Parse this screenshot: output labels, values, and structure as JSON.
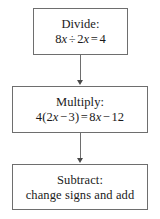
{
  "diagram": {
    "background_color": "#ffffff",
    "border_color": "#6e6e6e",
    "text_color": "#1a1a1a",
    "nodes": [
      {
        "id": "divide",
        "title": "Divide:",
        "body": "8x ÷ 2x = 4",
        "body_parts": {
          "a_coef": "8",
          "a_var": "x",
          "op1": "÷",
          "b_coef": "2",
          "b_var": "x",
          "eq": "=",
          "result": "4"
        }
      },
      {
        "id": "multiply",
        "title": "Multiply:",
        "body": "4(2x − 3) = 8x − 12",
        "body_parts": {
          "factor": "4(2",
          "v1": "x",
          "op1": "−",
          "term1": "3)",
          "eq": "=",
          "coef2": "8",
          "v2": "x",
          "op2": "−",
          "term2": "12"
        }
      },
      {
        "id": "subtract",
        "title": "Subtract:",
        "body": "change signs and add"
      }
    ],
    "connectors": [
      {
        "id": "divide-to-multiply",
        "from": "divide",
        "to": "multiply",
        "arrow": "down-arrow"
      },
      {
        "id": "multiply-to-subtract",
        "from": "multiply",
        "to": "subtract",
        "arrow": "down-arrow"
      }
    ]
  }
}
